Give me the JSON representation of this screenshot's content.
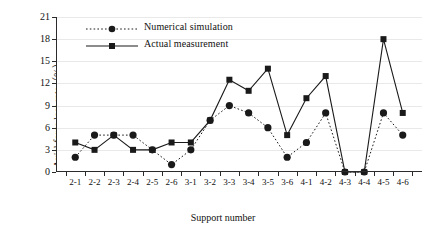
{
  "chart_data": {
    "type": "line",
    "title": "",
    "xlabel": "Support number",
    "ylabel": "Axial force loss rate（%）",
    "ylim": [
      0,
      21
    ],
    "yticks": [
      0,
      3,
      6,
      9,
      12,
      15,
      18,
      21
    ],
    "grid": true,
    "legend_position": "top-center",
    "categories": [
      "2-1",
      "2-2",
      "2-3",
      "2-4",
      "2-5",
      "2-6",
      "3-1",
      "3-2",
      "3-3",
      "3-4",
      "3-5",
      "3-6",
      "4-1",
      "4-2",
      "4-3",
      "4-4",
      "4-5",
      "4-6"
    ],
    "series": [
      {
        "name": "Numerical simulation",
        "marker": "circle",
        "line_style": "dotted",
        "color": "#1a1a1a",
        "values": [
          2,
          5,
          5,
          5,
          3,
          1,
          3,
          7,
          9,
          8,
          6,
          2,
          4,
          8,
          0,
          0,
          8,
          5
        ]
      },
      {
        "name": "Actual measurement",
        "marker": "square",
        "line_style": "solid",
        "color": "#1a1a1a",
        "values": [
          4,
          3,
          5,
          3,
          3,
          4,
          4,
          7,
          12.5,
          11,
          14,
          5,
          10,
          13,
          0,
          0,
          18,
          8
        ]
      }
    ]
  },
  "legend": {
    "items": [
      {
        "label": "Numerical simulation"
      },
      {
        "label": "Actual measurement"
      }
    ]
  },
  "axes": {
    "y_title": "Axial force loss rate（%）",
    "x_title": "Support number",
    "y_tick_labels": [
      "0",
      "3",
      "6",
      "9",
      "12",
      "15",
      "18",
      "21"
    ],
    "x_tick_labels": [
      "2-1",
      "2-2",
      "2-3",
      "2-4",
      "2-5",
      "2-6",
      "3-1",
      "3-2",
      "3-3",
      "3-4",
      "3-5",
      "3-6",
      "4-1",
      "4-2",
      "4-3",
      "4-4",
      "4-5",
      "4-6"
    ]
  },
  "colors": {
    "ink": "#1a1a1a",
    "grid": "#e9e9e9",
    "axis": "#2b2b2b",
    "background": "#ffffff"
  }
}
